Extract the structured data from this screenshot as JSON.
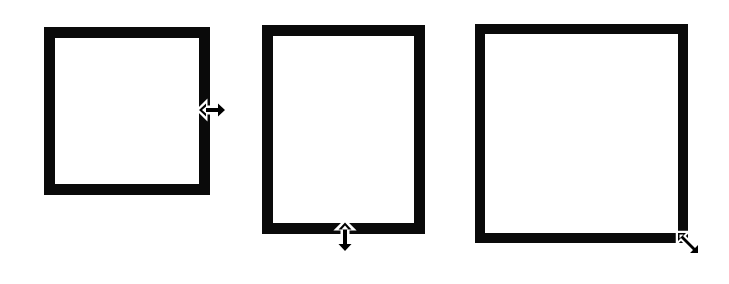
{
  "diagram": {
    "frames": [
      {
        "id": "frame-1",
        "x": 44,
        "y": 27,
        "width": 166,
        "height": 168,
        "border": 11,
        "cursor": "horizontal-resize-icon",
        "handle": "right-edge"
      },
      {
        "id": "frame-2",
        "x": 262,
        "y": 25,
        "width": 163,
        "height": 209,
        "border": 11,
        "cursor": "vertical-resize-icon",
        "handle": "bottom-edge"
      },
      {
        "id": "frame-3",
        "x": 475,
        "y": 24,
        "width": 213,
        "height": 219,
        "border": 10,
        "cursor": "diagonal-resize-icon",
        "handle": "bottom-right-corner"
      }
    ],
    "colors": {
      "border": "#0a0a0a",
      "background": "#ffffff",
      "cursor": "#000000"
    }
  }
}
